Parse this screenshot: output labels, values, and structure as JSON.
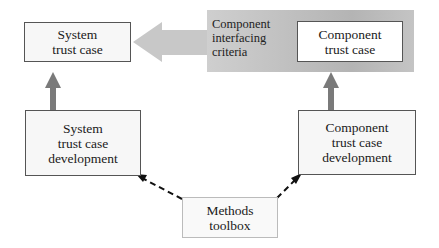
{
  "diagram": {
    "nodes": {
      "system_trust_case": {
        "label": "System\ntrust case"
      },
      "component_trust_case": {
        "label": "Component\ntrust case"
      },
      "system_development": {
        "label": "System\ntrust case\ndevelopment"
      },
      "component_development": {
        "label": "Component\ntrust case\ndevelopment"
      },
      "methods_toolbox": {
        "label": "Methods\ntoolbox"
      }
    },
    "interface_panel": {
      "label": "Component\ninterfacing\ncriteria"
    },
    "edges": [
      {
        "from": "component_trust_case",
        "to": "system_trust_case",
        "style": "wide gray arrow",
        "via": "Component interfacing criteria"
      },
      {
        "from": "system_development",
        "to": "system_trust_case",
        "style": "solid dark gray arrow"
      },
      {
        "from": "component_development",
        "to": "component_trust_case",
        "style": "solid dark gray arrow"
      },
      {
        "from": "methods_toolbox",
        "to": "system_development",
        "style": "dashed arrow"
      },
      {
        "from": "methods_toolbox",
        "to": "component_development",
        "style": "dashed arrow"
      }
    ],
    "colors": {
      "panel": "#bdbdbd",
      "big_arrow": "#c6c6c6",
      "up_arrow": "#7a7a7a",
      "box_border": "#555555"
    }
  }
}
